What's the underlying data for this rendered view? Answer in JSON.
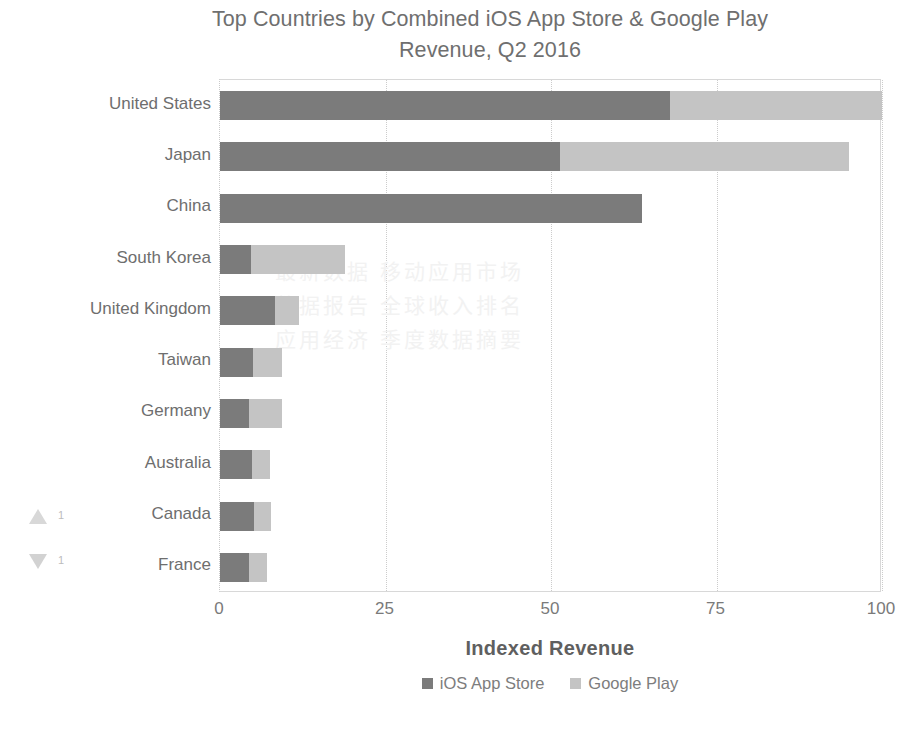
{
  "chart_data": {
    "type": "bar",
    "orientation": "horizontal",
    "stacked": true,
    "title": "Top Countries by Combined iOS App Store & Google Play\nRevenue, Q2 2016",
    "xlabel": "Indexed Revenue",
    "ylabel": "",
    "xlim": [
      0,
      100
    ],
    "xticks": [
      "0",
      "25",
      "50",
      "75",
      "100"
    ],
    "xtick_values": [
      0,
      25,
      50,
      75,
      100
    ],
    "grid": "vertical-dotted",
    "legend_position": "bottom",
    "categories": [
      "United States",
      "Japan",
      "China",
      "South Korea",
      "United Kingdom",
      "Taiwan",
      "Germany",
      "Australia",
      "Canada",
      "France"
    ],
    "series": [
      {
        "name": "iOS App Store",
        "color": "#7b7b7b",
        "values": [
          68.0,
          51.3,
          63.7,
          4.7,
          8.3,
          5.0,
          4.4,
          4.8,
          5.1,
          4.4
        ]
      },
      {
        "name": "Google Play",
        "color": "#c4c4c4",
        "values": [
          32.0,
          43.7,
          0.0,
          14.2,
          3.6,
          4.4,
          5.0,
          2.8,
          2.6,
          2.7
        ]
      }
    ],
    "totals": [
      100.0,
      95.0,
      63.7,
      18.9,
      11.9,
      9.4,
      9.4,
      7.6,
      7.7,
      7.1
    ],
    "watermark": "最新数据  移动应用市场\n数据报告  全球收入排名\n应用经济  季度数据摘要"
  },
  "legend": {
    "items": [
      {
        "label": "iOS App Store",
        "swatch_class": "sw-ios"
      },
      {
        "label": "Google Play",
        "swatch_class": "sw-gplay"
      }
    ]
  },
  "artifacts": {
    "up_marker": "1",
    "down_marker": "1"
  }
}
